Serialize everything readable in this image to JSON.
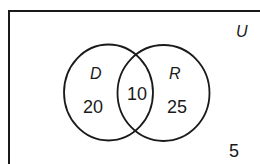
{
  "diagram": {
    "type": "venn",
    "universal_label": "U",
    "sets": [
      {
        "label": "D",
        "only_count": "20"
      },
      {
        "label": "R",
        "only_count": "25"
      }
    ],
    "intersection_count": "10",
    "outside_count": "5",
    "colors": {
      "stroke": "#1a1a1a",
      "background": "#ffffff"
    }
  }
}
